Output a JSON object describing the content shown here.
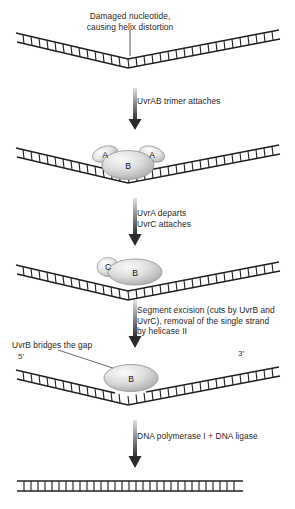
{
  "figure": {
    "background_color": "#ffffff",
    "line_color": "#231f20"
  },
  "labels": {
    "damage": {
      "line1": "Damaged nucleotide,",
      "line2": "causing helix distortion"
    },
    "uvrb_bridge": "UvrB bridges the gap",
    "five_prime": "5′",
    "three_prime": "3′"
  },
  "steps": [
    {
      "id": "step-uvrab",
      "arrow_label_lines": [
        "UvrAB trimer attaches"
      ]
    },
    {
      "id": "step-uvrc",
      "arrow_label_lines": [
        "UvrA departs",
        "UvrC attaches"
      ]
    },
    {
      "id": "step-excision",
      "arrow_label_lines": [
        "Segment excision (cuts by UvrB and",
        "UvrC), removal of the single strand",
        "by helicase II"
      ]
    },
    {
      "id": "step-polymerase",
      "arrow_label_lines": [
        "DNA polymerase I + DNA ligase"
      ]
    }
  ],
  "proteins": {
    "uvra_left": "A",
    "uvra_right": "A",
    "uvrb_trimer": "B",
    "uvrc": "C",
    "uvrb_with_c": "B",
    "uvrb_bridging": "B"
  },
  "panels": [
    {
      "id": "panel-damaged-dna",
      "name": "bent DNA duplex with damaged nucleotide"
    },
    {
      "id": "panel-uvrab-bound",
      "name": "bent DNA with UvrAB trimer bound"
    },
    {
      "id": "panel-uvrbc-bound",
      "name": "bent DNA with UvrB and UvrC bound"
    },
    {
      "id": "panel-gap-bridged",
      "name": "bent DNA with single-strand gap bridged by UvrB"
    },
    {
      "id": "panel-repaired-dna",
      "name": "repaired straight DNA duplex"
    }
  ],
  "colors": {
    "protein_fill_light": "#f2f2f2",
    "protein_fill_mid": "#b9b9b9",
    "protein_stroke": "#8c8c8c",
    "arrow_dark": "#2b2b2b",
    "arrow_light": "#d8d8d8",
    "dna_stroke": "#231f20"
  }
}
